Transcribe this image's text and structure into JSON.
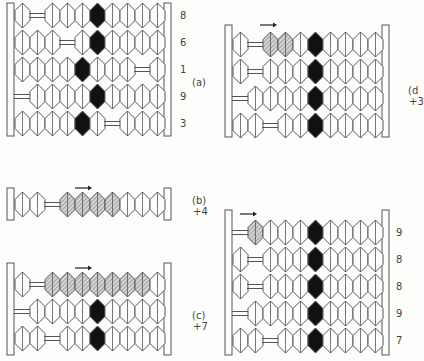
{
  "figure": {
    "bead_w": 15,
    "bead_h": 25,
    "colors": {
      "line": "#555555",
      "black": "#111111",
      "hatch": "#8a8a8a",
      "paper": "#fdfdfb"
    },
    "panels": [
      {
        "id": "a",
        "label": "(a)",
        "sub": "",
        "x": 15,
        "y": 3,
        "row_h": 27,
        "frame_left": 7,
        "frame_right": 164,
        "frame_top": 3,
        "frame_bottom": 136,
        "label_x": 192,
        "label_y": 78,
        "arrow": null,
        "rows": [
          {
            "value": "8",
            "slots": [
              "p",
              "g",
              "p",
              "p",
              "p",
              "b",
              "p",
              "p",
              "p",
              "p"
            ]
          },
          {
            "value": "6",
            "slots": [
              "p",
              "p",
              "p",
              "g",
              "p",
              "b",
              "p",
              "p",
              "p",
              "p"
            ]
          },
          {
            "value": "1",
            "slots": [
              "p",
              "p",
              "p",
              "p",
              "b",
              "p",
              "p",
              "p",
              "g",
              "p"
            ]
          },
          {
            "value": "9",
            "slots": [
              "g",
              "p",
              "p",
              "p",
              "p",
              "b",
              "p",
              "p",
              "p",
              "p"
            ]
          },
          {
            "value": "3",
            "slots": [
              "p",
              "p",
              "p",
              "p",
              "b",
              "p",
              "g",
              "p",
              "p",
              "p"
            ]
          }
        ],
        "value_x": 180
      },
      {
        "id": "b",
        "label": "(b)",
        "sub": "+4",
        "x": 15,
        "y": 192,
        "row_h": 27,
        "frame_left": 7,
        "frame_right": 164,
        "frame_top": 188,
        "frame_bottom": 220,
        "label_x": 192,
        "label_y": 196,
        "arrow": {
          "x": 75,
          "y": 188,
          "w": 14
        },
        "rows": [
          {
            "value": "",
            "slots": [
              "p",
              "p",
              "g",
              "h",
              "h",
              "h",
              "h",
              "p",
              "p",
              "p"
            ]
          }
        ],
        "value_x": 0
      },
      {
        "id": "c",
        "label": "(c)",
        "sub": "+7",
        "x": 15,
        "y": 272,
        "row_h": 27,
        "frame_left": 7,
        "frame_right": 164,
        "frame_top": 263,
        "frame_bottom": 355,
        "label_x": 192,
        "label_y": 311,
        "arrow": {
          "x": 75,
          "y": 268,
          "w": 14
        },
        "rows": [
          {
            "value": "",
            "slots": [
              "p",
              "g",
              "h",
              "h",
              "h",
              "h",
              "h",
              "h",
              "h",
              "p"
            ]
          },
          {
            "value": "",
            "slots": [
              "g",
              "p",
              "p",
              "p",
              "p",
              "b",
              "p",
              "p",
              "p",
              "p"
            ]
          },
          {
            "value": "",
            "slots": [
              "p",
              "p",
              "g",
              "p",
              "p",
              "b",
              "p",
              "p",
              "p",
              "p"
            ]
          }
        ],
        "value_x": 0
      },
      {
        "id": "d",
        "label": "(d",
        "sub": "+3",
        "x": 233,
        "y": 32,
        "row_h": 27,
        "frame_left": 225,
        "frame_right": 382,
        "frame_top": 25,
        "frame_bottom": 137,
        "label_x": 408,
        "label_y": 86,
        "arrow": {
          "x": 260,
          "y": 25,
          "w": 14
        },
        "rows": [
          {
            "value": "",
            "slots": [
              "p",
              "g",
              "h",
              "h",
              "p",
              "b",
              "p",
              "p",
              "p",
              "p"
            ]
          },
          {
            "value": "",
            "slots": [
              "p",
              "g",
              "p",
              "p",
              "p",
              "b",
              "p",
              "p",
              "p",
              "p"
            ]
          },
          {
            "value": "",
            "slots": [
              "g",
              "p",
              "p",
              "p",
              "p",
              "b",
              "p",
              "p",
              "p",
              "p"
            ]
          },
          {
            "value": "",
            "slots": [
              "p",
              "p",
              "g",
              "p",
              "p",
              "b",
              "p",
              "p",
              "p",
              "p"
            ]
          }
        ],
        "value_x": 0
      },
      {
        "id": "e",
        "label": "",
        "sub": "",
        "x": 233,
        "y": 220,
        "row_h": 27,
        "frame_left": 225,
        "frame_right": 382,
        "frame_top": 210,
        "frame_bottom": 355,
        "label_x": 0,
        "label_y": 0,
        "arrow": {
          "x": 240,
          "y": 214,
          "w": 14
        },
        "rows": [
          {
            "value": "9",
            "slots": [
              "g",
              "h",
              "p",
              "p",
              "p",
              "b",
              "p",
              "p",
              "p",
              "p"
            ]
          },
          {
            "value": "8",
            "slots": [
              "p",
              "g",
              "p",
              "p",
              "p",
              "b",
              "p",
              "p",
              "p",
              "p"
            ]
          },
          {
            "value": "8",
            "slots": [
              "p",
              "g",
              "p",
              "p",
              "p",
              "b",
              "p",
              "p",
              "p",
              "p"
            ]
          },
          {
            "value": "9",
            "slots": [
              "g",
              "p",
              "p",
              "p",
              "p",
              "b",
              "p",
              "p",
              "p",
              "p"
            ]
          },
          {
            "value": "7",
            "slots": [
              "p",
              "p",
              "g",
              "p",
              "p",
              "b",
              "p",
              "p",
              "p",
              "p"
            ]
          }
        ],
        "value_x": 396
      }
    ]
  }
}
